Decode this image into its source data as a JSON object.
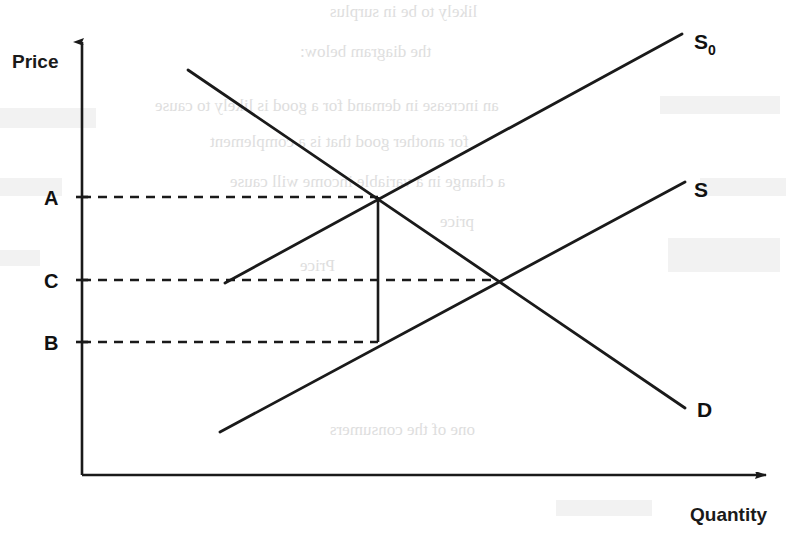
{
  "figure": {
    "kind": "supply-and-demand-diagram",
    "background_color": "#ffffff",
    "ink_color": "#1a1a1a"
  },
  "axes": {
    "y_label": "Price",
    "x_label": "Quantity",
    "origin": {
      "x": 82,
      "y": 475
    },
    "y_axis_top": 35,
    "x_axis_right": 775
  },
  "price_levels": [
    {
      "label": "A",
      "y": 197,
      "dash_end_x": 378,
      "label_x": 52,
      "label_y": 204
    },
    {
      "label": "C",
      "y": 280,
      "dash_end_x": 497,
      "label_x": 52,
      "label_y": 287
    },
    {
      "label": "B",
      "y": 342,
      "dash_end_x": 378,
      "label_x": 52,
      "label_y": 349
    }
  ],
  "curves": [
    {
      "name": "demand",
      "label": "D",
      "label_x": 697,
      "label_y": 417,
      "x1": 188,
      "y1": 70,
      "x2": 685,
      "y2": 408
    },
    {
      "name": "supply-shifted",
      "label": "S",
      "sublabel": "0",
      "label_x": 694,
      "label_y": 49,
      "x1": 225,
      "y1": 283,
      "x2": 682,
      "y2": 34
    },
    {
      "name": "supply",
      "label": "S",
      "label_x": 694,
      "label_y": 197,
      "x1": 220,
      "y1": 432,
      "x2": 685,
      "y2": 182
    }
  ],
  "intersections": [
    {
      "name": "equilibrium-s0-d",
      "x": 378,
      "y": 197,
      "price_level": "A"
    },
    {
      "name": "equilibrium-s-d",
      "x": 497,
      "y": 280,
      "price_level": "C"
    },
    {
      "name": "supply-at-quantity",
      "x": 378,
      "y": 342,
      "price_level": "B"
    }
  ],
  "drop_line": {
    "x": 378,
    "y_top": 197,
    "y_bottom": 342
  },
  "chart_data": {
    "type": "line",
    "title": "",
    "xlabel": "Quantity",
    "ylabel": "Price",
    "grid": false,
    "legend": "inline-curve-labels",
    "y_tick_labels": [
      "A",
      "C",
      "B"
    ],
    "x_tick_labels": [],
    "annotations": [
      "Dashed horizontal line at price A to the S0-D equilibrium",
      "Dashed horizontal line at price C to the S-D equilibrium",
      "Dashed horizontal line at price B to the S curve",
      "Vertical line from price A down to price B at the equilibrium quantity"
    ],
    "series": [
      {
        "name": "D",
        "description": "Demand curve, downward sloping",
        "points": [
          [
            188,
            70
          ],
          [
            685,
            408
          ]
        ]
      },
      {
        "name": "S0",
        "description": "Shifted supply curve, upward sloping, begins at price level C",
        "points": [
          [
            225,
            283
          ],
          [
            682,
            34
          ]
        ]
      },
      {
        "name": "S",
        "description": "Original supply curve, upward sloping",
        "points": [
          [
            220,
            432
          ],
          [
            685,
            182
          ]
        ]
      }
    ]
  },
  "ghost_text": {
    "note": "faint mirrored bleed-through from reverse page",
    "lines": [
      {
        "text": "likely to be in surplus",
        "x": 330,
        "y": 2,
        "size": 17
      },
      {
        "text": "the diagram below:",
        "x": 300,
        "y": 42,
        "size": 17
      },
      {
        "text": "an increase in demand for a good is likely to cause",
        "x": 155,
        "y": 96,
        "size": 17
      },
      {
        "text": "for another good that is a complement",
        "x": 210,
        "y": 132,
        "size": 17
      },
      {
        "text": "a change in a variable income will cause",
        "x": 230,
        "y": 172,
        "size": 17
      },
      {
        "text": "price",
        "x": 440,
        "y": 212,
        "size": 17
      },
      {
        "text": "Price",
        "x": 300,
        "y": 256,
        "size": 17
      },
      {
        "text": "one of the consumers",
        "x": 330,
        "y": 420,
        "size": 17
      }
    ],
    "blocks": [
      {
        "x": 0,
        "y": 108,
        "w": 96,
        "h": 20
      },
      {
        "x": 0,
        "y": 178,
        "w": 62,
        "h": 18
      },
      {
        "x": 660,
        "y": 96,
        "w": 120,
        "h": 18
      },
      {
        "x": 700,
        "y": 178,
        "w": 86,
        "h": 18
      },
      {
        "x": 0,
        "y": 250,
        "w": 40,
        "h": 16
      },
      {
        "x": 668,
        "y": 238,
        "w": 112,
        "h": 34
      },
      {
        "x": 556,
        "y": 500,
        "w": 96,
        "h": 16
      }
    ]
  }
}
